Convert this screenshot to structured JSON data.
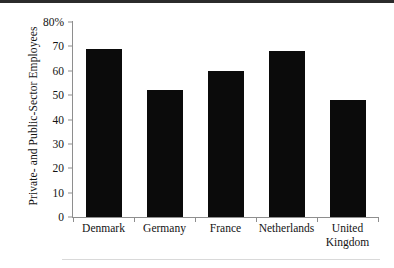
{
  "chart_data": {
    "type": "bar",
    "title": "",
    "subtitle": "",
    "xlabel": "",
    "ylabel": "Private- and Public-Sector Employees",
    "categories": [
      "Denmark",
      "Germany",
      "France",
      "Netherlands",
      "United Kingdom"
    ],
    "category_lines": [
      [
        "Denmark"
      ],
      [
        "Germany"
      ],
      [
        "France"
      ],
      [
        "Netherlands"
      ],
      [
        "United",
        "Kingdom"
      ]
    ],
    "values": [
      69,
      52,
      60,
      68,
      48
    ],
    "ylim": [
      0,
      80
    ],
    "ytick_values": [
      0,
      10,
      20,
      30,
      40,
      50,
      60,
      70,
      80
    ],
    "ytick_labels": [
      "0",
      "10",
      "20",
      "30",
      "40",
      "50",
      "60",
      "70",
      "80%"
    ],
    "grid": false,
    "legend": null,
    "legend_position": "none",
    "bar_color": "#0b0b0b",
    "axis_color": "#8e8e8e",
    "units": "percent"
  },
  "figure": {
    "bottom_rule_color": "#d9d9d9",
    "background": "#ffffff",
    "top_edge_color": "#2b2b2b"
  }
}
